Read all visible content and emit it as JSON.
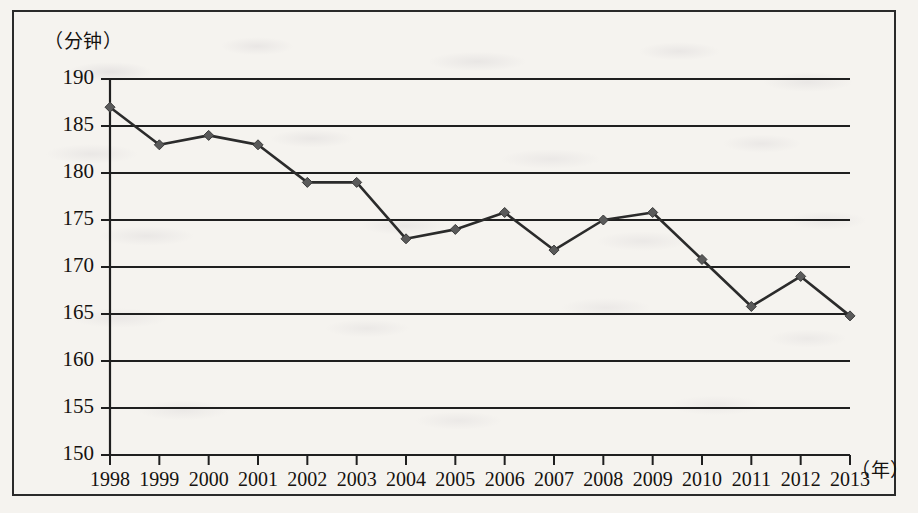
{
  "figure": {
    "y_axis_unit_label": "（分钟）",
    "x_axis_unit_label": "（年）"
  },
  "chart_data": {
    "type": "line",
    "title": "",
    "subtitle": "",
    "xlabel": "（年）",
    "ylabel": "（分钟）",
    "x": [
      1998,
      1999,
      2000,
      2001,
      2002,
      2003,
      2004,
      2005,
      2006,
      2007,
      2008,
      2009,
      2010,
      2011,
      2012,
      2013
    ],
    "categories": [
      "1998",
      "1999",
      "2000",
      "2001",
      "2002",
      "2003",
      "2004",
      "2005",
      "2006",
      "2007",
      "2008",
      "2009",
      "2010",
      "2011",
      "2012",
      "2013"
    ],
    "values": [
      187.0,
      183.0,
      184.0,
      183.0,
      179.0,
      179.0,
      173.0,
      174.0,
      175.8,
      171.8,
      175.0,
      175.8,
      170.8,
      165.8,
      169.0,
      164.8
    ],
    "series": [
      {
        "name": "",
        "values": [
          187.0,
          183.0,
          184.0,
          183.0,
          179.0,
          179.0,
          173.0,
          174.0,
          175.8,
          171.8,
          175.0,
          175.8,
          170.8,
          165.8,
          169.0,
          164.8
        ]
      }
    ],
    "ylim": [
      150,
      190
    ],
    "xlim": [
      1998,
      2013
    ],
    "ytick_labels": [
      "150",
      "155",
      "160",
      "165",
      "170",
      "175",
      "180",
      "185",
      "190"
    ],
    "ytick_values": [
      150,
      155,
      160,
      165,
      170,
      175,
      180,
      185,
      190
    ],
    "xtick_labels": [
      "1998",
      "1999",
      "2000",
      "2001",
      "2002",
      "2003",
      "2004",
      "2005",
      "2006",
      "2007",
      "2008",
      "2009",
      "2010",
      "2011",
      "2012",
      "2013"
    ],
    "grid": {
      "horizontal": true,
      "vertical": false
    },
    "legend": {
      "visible": false,
      "position": "none"
    },
    "marker": "diamond",
    "line_color": "#2b2b2b",
    "marker_color": "#5a5a5a",
    "grid_color": "#1f1f1f"
  }
}
